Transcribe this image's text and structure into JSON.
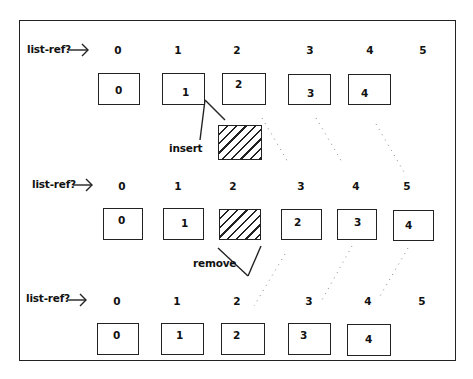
{
  "diagram": {
    "rows": [
      {
        "id": "before-insert",
        "label": "list-ref?",
        "indices": [
          "0",
          "1",
          "2",
          "3",
          "4",
          "5"
        ],
        "cells": [
          "0",
          "1",
          "2",
          "3",
          "4"
        ]
      },
      {
        "id": "after-insert",
        "label": "list-ref?",
        "indices": [
          "0",
          "1",
          "2",
          "3",
          "4",
          "5"
        ],
        "cells": [
          "0",
          "1",
          "",
          "2",
          "3",
          "4"
        ]
      },
      {
        "id": "after-remove",
        "label": "list-ref?",
        "indices": [
          "0",
          "1",
          "2",
          "3",
          "4",
          "5"
        ],
        "cells": [
          "0",
          "1",
          "2",
          "3",
          "4"
        ]
      }
    ],
    "annotations": {
      "insert": "insert",
      "remove": "remove"
    },
    "arrow_icon": "right-arrow-icon",
    "colors": {
      "stroke": "#222222",
      "background": "#ffffff",
      "dots": "#888888"
    }
  }
}
